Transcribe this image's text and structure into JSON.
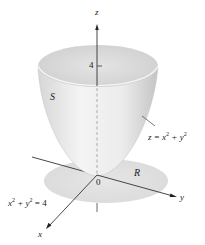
{
  "figure": {
    "type": "3d-surface-diagram",
    "colors": {
      "surface_light": "#f2f2f2",
      "surface_dark": "#c9c9c9",
      "region": "#e0e0e0",
      "axis": "#333333"
    }
  },
  "labels": {
    "z_axis": "z",
    "y_axis": "y",
    "x_axis": "x",
    "origin": "0",
    "tick_4": "4",
    "surface": "S",
    "region": "R",
    "surface_eq": {
      "lhs": "z = x",
      "exp1": "2",
      "mid": " + y",
      "exp2": "2"
    },
    "boundary_eq": {
      "x": "x",
      "exp1": "2",
      "mid": " + y",
      "exp2": "2",
      "rhs": " = 4"
    }
  }
}
